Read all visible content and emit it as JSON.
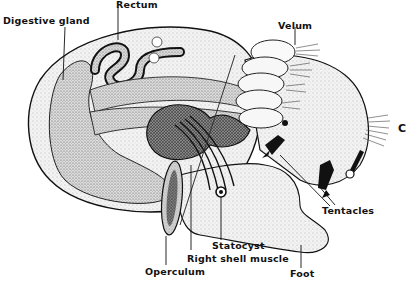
{
  "figure": {
    "panel_letter": "C",
    "labels": {
      "digestive_gland": "Digestive gland",
      "rectum": "Rectum",
      "velum": "Velum",
      "tentacles": "Tentacles",
      "statocyst": "Statocyst",
      "right_shell_muscle": "Right shell muscle",
      "operculum": "Operculum",
      "foot": "Foot"
    },
    "colors": {
      "ink": "#111111",
      "background": "#ffffff",
      "stipple_light": "#e6e6e6",
      "stipple_mid": "#c8c8c8",
      "stipple_dark": "#6a6a6a"
    }
  }
}
